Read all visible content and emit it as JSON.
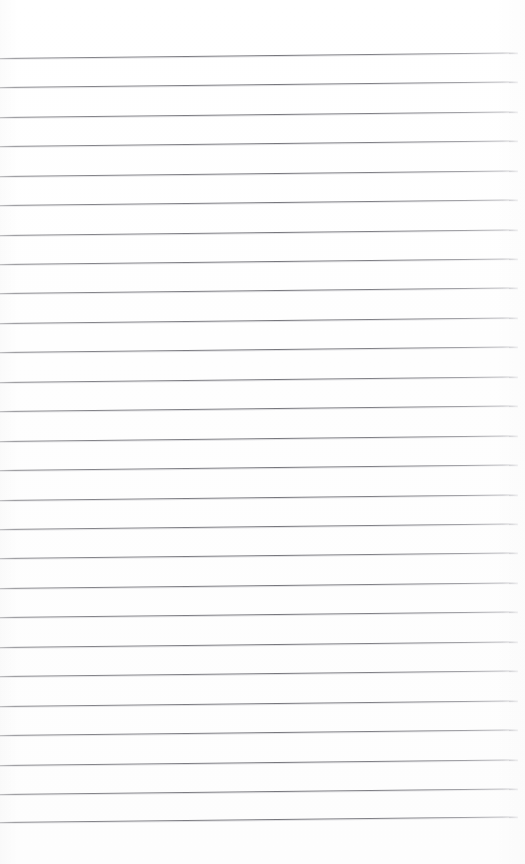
{
  "document": {
    "kind": "scanned-lined-notepad-page",
    "title": "Blank Lined Notepad Page",
    "page_width": 525,
    "page_height": 864,
    "background_color": "#ffffff",
    "paper_tone": "#fefefe",
    "has_text_content": false,
    "has_handwriting": false,
    "has_header": false,
    "has_footer": false,
    "has_page_number": false,
    "has_margin_rule": false,
    "visible_text": ""
  },
  "ruling": {
    "line_color": "#78787e",
    "line_color_light": "#b4b4ba",
    "line_thickness_px": 1,
    "line_count": 26,
    "first_line_y": 58,
    "line_spacing_px": 29.5,
    "left_inset_px": 0,
    "right_end_px": 518,
    "skew_deg": -0.62,
    "skew_drop_px": 5.5,
    "top_margin_px": 56,
    "bottom_margin_px": 42
  },
  "lines": [
    {
      "index": 1,
      "y": 58
    },
    {
      "index": 2,
      "y": 87
    },
    {
      "index": 3,
      "y": 117
    },
    {
      "index": 4,
      "y": 146
    },
    {
      "index": 5,
      "y": 176
    },
    {
      "index": 6,
      "y": 205
    },
    {
      "index": 7,
      "y": 235
    },
    {
      "index": 8,
      "y": 264
    },
    {
      "index": 9,
      "y": 293
    },
    {
      "index": 10,
      "y": 323
    },
    {
      "index": 11,
      "y": 352
    },
    {
      "index": 12,
      "y": 382
    },
    {
      "index": 13,
      "y": 411
    },
    {
      "index": 14,
      "y": 441
    },
    {
      "index": 15,
      "y": 470
    },
    {
      "index": 16,
      "y": 500
    },
    {
      "index": 17,
      "y": 529
    },
    {
      "index": 18,
      "y": 558
    },
    {
      "index": 19,
      "y": 588
    },
    {
      "index": 20,
      "y": 617
    },
    {
      "index": 21,
      "y": 647
    },
    {
      "index": 22,
      "y": 676
    },
    {
      "index": 23,
      "y": 706
    },
    {
      "index": 24,
      "y": 735
    },
    {
      "index": 25,
      "y": 765
    },
    {
      "index": 26,
      "y": 794
    },
    {
      "index": 27,
      "y": 822
    }
  ]
}
